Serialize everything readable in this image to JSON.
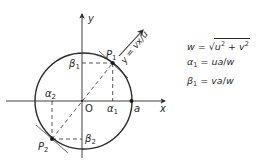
{
  "figure": {
    "axes": {
      "x_label": "x",
      "y_label": "y",
      "origin_label": "O"
    },
    "circle_point_label": "a",
    "points": {
      "p1": {
        "label": "P",
        "subscript": "1"
      },
      "p2": {
        "label": "P",
        "subscript": "2"
      }
    },
    "projections": {
      "alpha1": {
        "label": "α",
        "subscript": "1"
      },
      "alpha2": {
        "label": "α",
        "subscript": "2"
      },
      "beta1": {
        "label": "β",
        "subscript": "1"
      },
      "beta2": {
        "label": "β",
        "subscript": "2"
      }
    },
    "direction_line_label": "y = vx/u",
    "colors": {
      "ink": "#2a2a2a",
      "background": "#ffffff"
    }
  },
  "equations": [
    {
      "lhs": "w",
      "rhs_prefix": "=",
      "rhs": "u² + v²",
      "note": "w = √(u² + v²)"
    },
    {
      "lhs": "α₁",
      "rhs": "= ua/w"
    },
    {
      "lhs": "β₁",
      "rhs": "= va/w"
    }
  ]
}
